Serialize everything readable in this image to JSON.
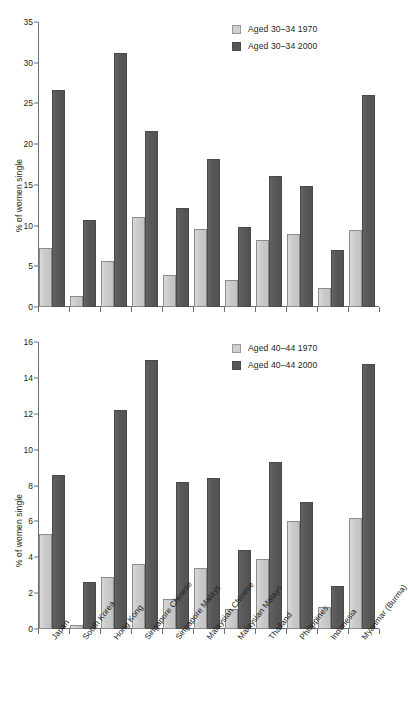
{
  "figure": {
    "background": "#ffffff",
    "colors": {
      "series_1970": "#cccccc",
      "series_2000": "#585858",
      "axis": "#6d6e71",
      "text": "#231f20"
    }
  },
  "categories": [
    "Japan",
    "South Korea",
    "Hong Kong",
    "Singapore Chinese",
    "Singapore Malays",
    "Malaysian Chinese",
    "Malaysian Malays",
    "Thailand",
    "Philippines",
    "Indonesia",
    "Myanmar (Burma)"
  ],
  "panel_top": {
    "ylabel": "% of women single",
    "yticks": [
      "0",
      "5",
      "10",
      "15",
      "20",
      "25",
      "30",
      "35"
    ],
    "legend": [
      {
        "label": "Aged 30–34 1970",
        "swatch": "series_1970"
      },
      {
        "label": "Aged 30–34 2000",
        "swatch": "series_2000"
      }
    ]
  },
  "panel_bottom": {
    "ylabel": "% of women single",
    "yticks": [
      "0",
      "2",
      "4",
      "6",
      "8",
      "10",
      "12",
      "14",
      "16"
    ],
    "legend": [
      {
        "label": "Aged 40–44 1970",
        "swatch": "series_1970"
      },
      {
        "label": "Aged 40–44 2000",
        "swatch": "series_2000"
      }
    ]
  },
  "chart_data": [
    {
      "type": "bar",
      "title": "",
      "xlabel": "",
      "ylabel": "% of women single",
      "ylim": [
        0,
        35
      ],
      "ytick_step": 5,
      "grid": false,
      "legend_position": "top-right",
      "categories": [
        "Japan",
        "South Korea",
        "Hong Kong",
        "Singapore Chinese",
        "Singapore Malays",
        "Malaysian Chinese",
        "Malaysian Malays",
        "Thailand",
        "Philippines",
        "Indonesia",
        "Myanmar (Burma)"
      ],
      "series": [
        {
          "name": "Aged 30–34 1970",
          "color": "#cccccc",
          "values": [
            7.2,
            1.4,
            5.6,
            11.1,
            3.9,
            9.6,
            3.3,
            8.2,
            9.0,
            2.3,
            9.4
          ]
        },
        {
          "name": "Aged 30–34 2000",
          "color": "#585858",
          "values": [
            26.6,
            10.7,
            31.2,
            21.6,
            12.2,
            18.2,
            9.8,
            16.1,
            14.9,
            7.0,
            26.0
          ]
        }
      ]
    },
    {
      "type": "bar",
      "title": "",
      "xlabel": "",
      "ylabel": "% of women single",
      "ylim": [
        0,
        16
      ],
      "ytick_step": 2,
      "grid": false,
      "legend_position": "top-right",
      "categories": [
        "Japan",
        "South Korea",
        "Hong Kong",
        "Singapore Chinese",
        "Singapore Malays",
        "Malaysian Chinese",
        "Malaysian Malays",
        "Thailand",
        "Philippines",
        "Indonesia",
        "Myanmar (Burma)"
      ],
      "series": [
        {
          "name": "Aged 40–44 1970",
          "color": "#cccccc",
          "values": [
            5.3,
            0.2,
            2.9,
            3.6,
            1.7,
            3.4,
            1.1,
            3.9,
            6.0,
            1.2,
            6.2
          ]
        },
        {
          "name": "Aged 40–44 2000",
          "color": "#585858",
          "values": [
            8.6,
            2.6,
            12.2,
            15.0,
            8.2,
            8.4,
            4.4,
            9.3,
            7.1,
            2.4,
            14.8
          ]
        }
      ]
    }
  ]
}
